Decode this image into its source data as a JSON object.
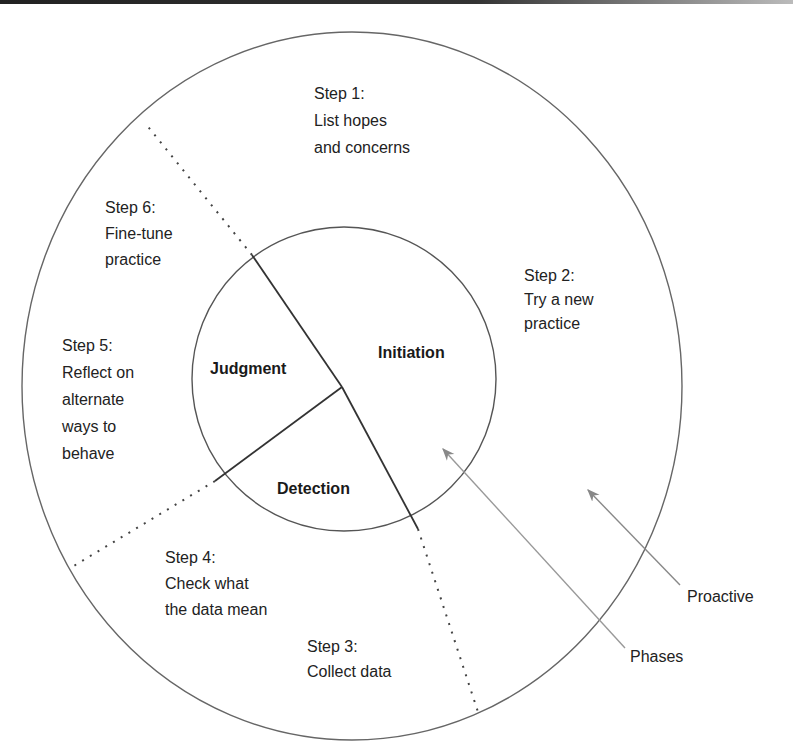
{
  "diagram": {
    "phases": [
      {
        "id": "initiation",
        "label": "Initiation"
      },
      {
        "id": "judgment",
        "label": "Judgment"
      },
      {
        "id": "detection",
        "label": "Detection"
      }
    ],
    "steps": [
      {
        "id": "step1",
        "title": "Step 1:",
        "lines": [
          "List hopes",
          "and concerns"
        ]
      },
      {
        "id": "step2",
        "title": "Step 2:",
        "lines": [
          "Try a new",
          "practice"
        ]
      },
      {
        "id": "step3",
        "title": "Step 3:",
        "lines": [
          "Collect data"
        ]
      },
      {
        "id": "step4",
        "title": "Step 4:",
        "lines": [
          "Check what",
          "the data mean"
        ]
      },
      {
        "id": "step5",
        "title": "Step 5:",
        "lines": [
          "Reflect on",
          "alternate",
          "ways to",
          "behave"
        ]
      },
      {
        "id": "step6",
        "title": "Step 6:",
        "lines": [
          "Fine-tune",
          "practice"
        ]
      }
    ],
    "callouts": [
      {
        "id": "proactive",
        "label": "Proactive"
      },
      {
        "id": "phases",
        "label": "Phases"
      }
    ],
    "colors": {
      "stroke": "#555555",
      "divider": "#333333",
      "arrow": "#888888",
      "text": "#222222"
    }
  }
}
